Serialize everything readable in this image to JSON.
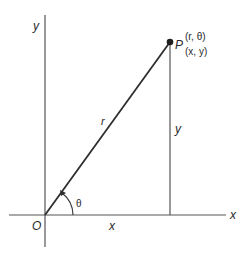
{
  "diagram": {
    "colors": {
      "line": "#3a3a3a",
      "axis": "#555555",
      "text": "#2a2a2a",
      "background": "#ffffff"
    },
    "axes": {
      "x_label": "x",
      "y_label": "y",
      "origin_label": "O"
    },
    "point": {
      "label": "P",
      "polar": "(r, θ)",
      "cartesian": "(x, y)"
    },
    "segments": {
      "radius_label": "r",
      "vertical_label": "y",
      "horizontal_label": "x"
    },
    "angle": {
      "label": "θ"
    }
  }
}
